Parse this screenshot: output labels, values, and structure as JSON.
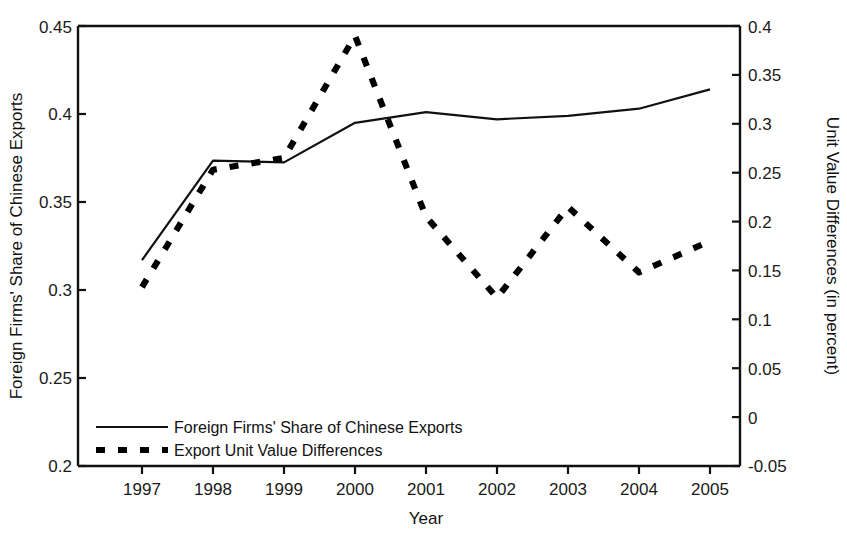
{
  "chart_data": {
    "type": "line",
    "title": "",
    "xlabel": "Year",
    "ylabel": "Foreign Firms' Share of Chinese Exports",
    "y2label": "Unit Value Differences (in percent)",
    "grid": false,
    "legend_position": "bottom-left-inside",
    "categories": [
      1997,
      1998,
      1999,
      2000,
      2001,
      2002,
      2003,
      2004,
      2005
    ],
    "x_tick_labels": [
      "1997",
      "1998",
      "1999",
      "2000",
      "2001",
      "2002",
      "2003",
      "2004",
      "2005"
    ],
    "xlim": [
      1996.65,
      2005.35
    ],
    "ylim": [
      0.2,
      0.45
    ],
    "y_tick_labels": [
      "0.2",
      "0.25",
      "0.3",
      "0.35",
      "0.4",
      "0.45"
    ],
    "y_ticks": [
      0.2,
      0.25,
      0.3,
      0.35,
      0.4,
      0.45
    ],
    "y2lim": [
      -0.05,
      0.4
    ],
    "y2_tick_labels": [
      "-0.05",
      "0",
      "0.05",
      "0.1",
      "0.15",
      "0.2",
      "0.25",
      "0.3",
      "0.35",
      "0.4"
    ],
    "y2_ticks": [
      -0.05,
      0,
      0.05,
      0.1,
      0.15,
      0.2,
      0.25,
      0.3,
      0.35,
      0.4
    ],
    "series": [
      {
        "name": "Foreign Firms' Share of Chinese Exports",
        "axis": "left",
        "style": "solid",
        "color": "#000000",
        "values": [
          0.317,
          0.3735,
          0.3725,
          0.395,
          0.401,
          0.397,
          0.399,
          0.403,
          0.414
        ]
      },
      {
        "name": "Export Unit Value Differences",
        "axis": "right",
        "style": "dashed",
        "color": "#000000",
        "values": [
          0.133,
          0.253,
          0.265,
          0.39,
          0.205,
          0.122,
          0.215,
          0.148,
          0.18
        ]
      }
    ]
  },
  "legend": {
    "items": [
      {
        "label": "Foreign Firms' Share of Chinese Exports",
        "style": "solid"
      },
      {
        "label": "Export Unit Value Differences",
        "style": "dashed"
      }
    ]
  },
  "axis_titles": {
    "left": "Foreign Firms' Share of Chinese Exports",
    "right": "Unit Value Differences (in percent)",
    "bottom": "Year"
  }
}
